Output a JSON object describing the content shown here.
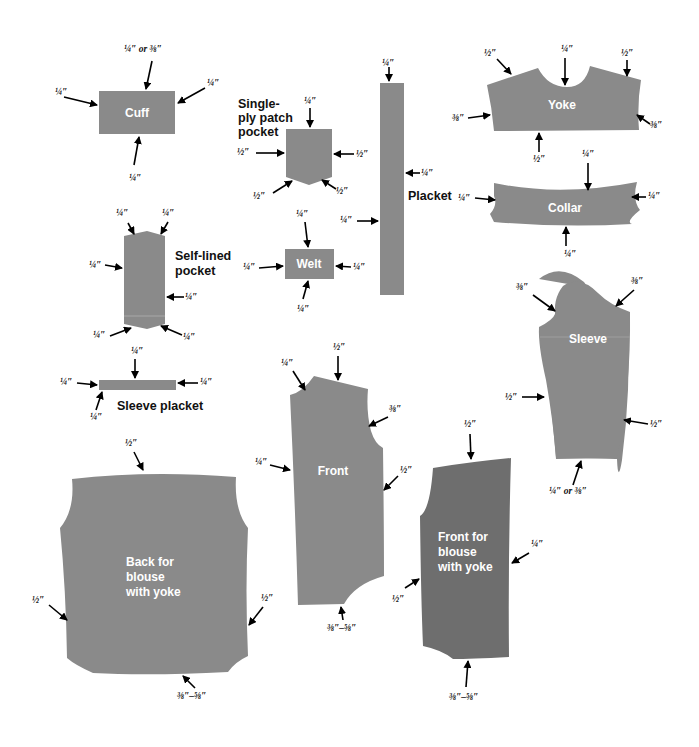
{
  "colors": {
    "piece": "#8a8a8a",
    "piece_dark": "#6e6e6e",
    "label": "#ffffff",
    "text": "#111111",
    "background": "#ffffff"
  },
  "pieces": {
    "cuff": {
      "label": "Cuff",
      "allowances": [
        "¼″ or ⅜″",
        "¼″",
        "¼″",
        "¼″"
      ]
    },
    "patch_pocket": {
      "title_lines": [
        "Single-",
        "ply patch",
        "pocket"
      ],
      "allowances": [
        "¼″",
        "½″",
        "½″",
        "½″",
        "½″"
      ]
    },
    "placket": {
      "label": "Placket",
      "allowances": [
        "¼″",
        "¼″",
        "¼″"
      ]
    },
    "yoke": {
      "label": "Yoke",
      "allowances": [
        "½″",
        "¼″",
        "½″",
        "⅜″",
        "⅜″",
        "½″"
      ]
    },
    "collar": {
      "label": "Collar",
      "allowances": [
        "¼″",
        "¼″",
        "¼″",
        "¼″"
      ]
    },
    "self_lined_pocket": {
      "title_lines": [
        "Self-lined",
        "pocket"
      ],
      "allowances": [
        "¼″",
        "¼″",
        "¼″",
        "¼″",
        "¼″",
        "¼″"
      ]
    },
    "welt": {
      "label": "Welt",
      "allowances": [
        "¼″",
        "¼″",
        "¼″",
        "¼″"
      ]
    },
    "sleeve_placket": {
      "label": "Sleeve placket",
      "allowances": [
        "¼″",
        "¼″",
        "¼″",
        "¼″"
      ]
    },
    "sleeve": {
      "label": "Sleeve",
      "allowances": [
        "⅜″",
        "⅜″",
        "½″",
        "½″",
        "¼″ or ⅜″"
      ]
    },
    "front": {
      "label": "Front",
      "allowances": [
        "¼″",
        "½″",
        "⅜″",
        "¼″",
        "½″",
        "⅜″–⅝″"
      ]
    },
    "back_yoke": {
      "label_lines": [
        "Back for",
        "blouse",
        "with yoke"
      ],
      "allowances": [
        "½″",
        "½″",
        "½″",
        "⅜″–⅝″"
      ]
    },
    "front_yoke": {
      "label_lines": [
        "Front for",
        "blouse",
        "with yoke"
      ],
      "allowances": [
        "½″",
        "¼″",
        "½″",
        "⅜″–⅝″"
      ]
    }
  }
}
